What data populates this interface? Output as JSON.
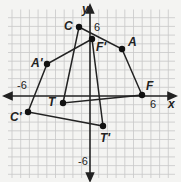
{
  "figure": {
    "x_axis_label": "x",
    "y_axis_label": "y",
    "tick_labels": {
      "x_pos": "6",
      "x_neg": "-6",
      "y_pos": "6",
      "y_neg": "-6"
    },
    "grid": true
  },
  "points": [
    {
      "name": "C",
      "label": "C",
      "px": [
        79,
        27
      ]
    },
    {
      "name": "F'",
      "label": "F'",
      "px": [
        92,
        39
      ]
    },
    {
      "name": "A",
      "label": "A",
      "px": [
        122,
        49
      ]
    },
    {
      "name": "F",
      "label": "F",
      "px": [
        142,
        95
      ]
    },
    {
      "name": "A'",
      "label": "A'",
      "px": [
        47,
        64
      ]
    },
    {
      "name": "T",
      "label": "T",
      "px": [
        63,
        103
      ]
    },
    {
      "name": "C'",
      "label": "C'",
      "px": [
        28,
        112
      ]
    },
    {
      "name": "T'",
      "label": "T'",
      "px": [
        103,
        126
      ]
    }
  ],
  "polygons": [
    {
      "name": "CAFT",
      "vertices": [
        "C",
        "A",
        "F",
        "T"
      ]
    },
    {
      "name": "C'A'F'T'",
      "vertices": [
        "C'",
        "A'",
        "F'",
        "T'"
      ]
    }
  ],
  "colors": {
    "line": "#222222",
    "grid": "#c8c8c8",
    "background": "#f4f4f2"
  }
}
